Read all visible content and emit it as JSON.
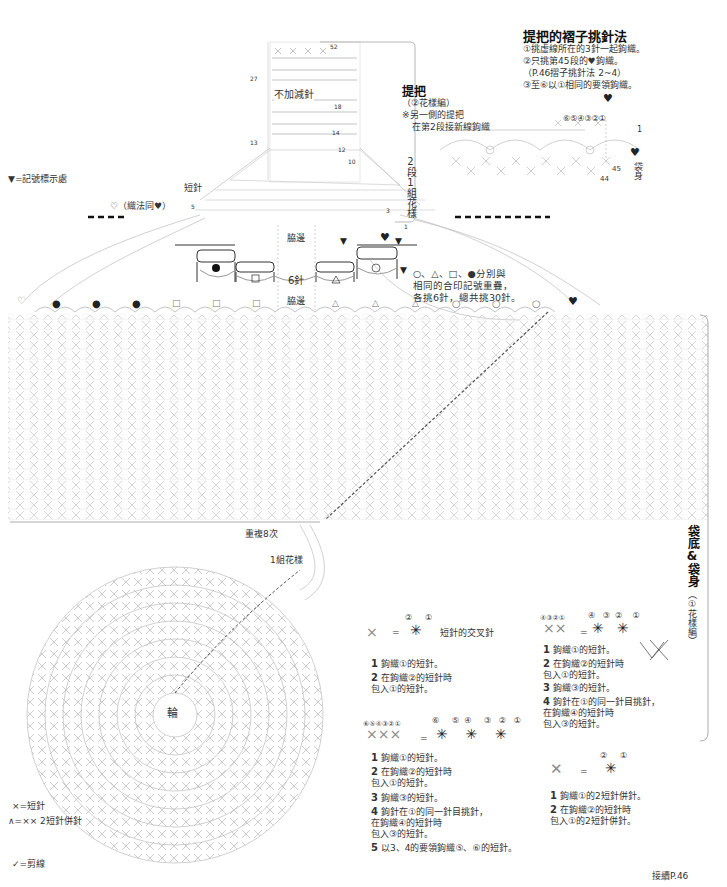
{
  "handle_pleat": {
    "title": "提把的褶子挑針法",
    "steps": [
      "①挑虛線所在的3針一起鉤織。",
      "②只挑第45段的♥鉤織。",
      "（P.46摺子挑針法 2~4）",
      "③至⑥以①相同的要領鉤織。"
    ],
    "marks": [
      "⑥",
      "⑤",
      "④",
      "③",
      "②",
      "①"
    ],
    "row_labels": [
      "1",
      "45",
      "44"
    ],
    "body_label": "袋身"
  },
  "handle": {
    "title": "提把",
    "subtitle": "（②花樣編）",
    "note_1": "※另一側的提把",
    "note_2": "在第2段接新線鉤織",
    "no_change": "不加減針",
    "pattern_repeat": "2段1組花樣",
    "row_numbers": [
      "52",
      "27",
      "18",
      "14",
      "13",
      "12",
      "10",
      "5",
      "3",
      "1"
    ],
    "short_stitch": "短針"
  },
  "legend_top": {
    "marker": "▼=記號標示處",
    "open_heart": "♡（織法同♥）"
  },
  "joining": {
    "side_label_top": "脇邊",
    "side_label_bottom": "脇邊",
    "six_stitches": "6針",
    "note_lines": [
      "○、△、□、●分別與",
      "相同的合印記號重疊，",
      "各挑6針，總共挑30針。"
    ],
    "symbols_top_row": [
      "●",
      "□",
      "6針",
      "△",
      "○"
    ],
    "symbols_edge": [
      "♡",
      "●",
      "●",
      "●",
      "□",
      "□",
      "□",
      "△",
      "△",
      "△",
      "○",
      "○",
      "○",
      "♥"
    ]
  },
  "body": {
    "repeat": "重複8次",
    "one_set": "1組花樣",
    "center": "輪",
    "side_title": "袋底&袋身",
    "side_sub": "（①花樣編）"
  },
  "diagram_1": {
    "marks": [
      "②",
      "①"
    ],
    "name": "短針的交叉針",
    "steps": [
      {
        "n": "1",
        "text": "鉤織①的短針。"
      },
      {
        "n": "2",
        "text": "在鉤織②的短針時\n包入①的短針。"
      }
    ]
  },
  "diagram_2": {
    "marks_left": "④③②①",
    "marks": [
      "④",
      "③",
      "②",
      "①"
    ],
    "steps": [
      {
        "n": "1",
        "text": "鉤織①的短針。"
      },
      {
        "n": "2",
        "text": "在鉤織②的短針時\n包入①的短針。"
      },
      {
        "n": "3",
        "text": "鉤織③的短針。"
      },
      {
        "n": "4",
        "text": "鉤針在①的同一針目挑針，\n在鉤織④的短針時\n包入③的短針。"
      }
    ]
  },
  "diagram_3": {
    "marks_left": "⑥⑤④③②①",
    "marks": [
      "⑥",
      "⑤",
      "④",
      "③",
      "②",
      "①"
    ],
    "steps": [
      {
        "n": "1",
        "text": "鉤織①的短針。"
      },
      {
        "n": "2",
        "text": "在鉤織②的短針時\n包入①的短針。"
      },
      {
        "n": "3",
        "text": "鉤織③的短針。"
      },
      {
        "n": "4",
        "text": "鉤針在①的同一針目挑針，\n在鉤織④的短針時\n包入③的短針。"
      },
      {
        "n": "5",
        "text": "以3、4的要領鉤織⑤、⑥的短針。"
      }
    ]
  },
  "diagram_4": {
    "marks": [
      "②",
      "①"
    ],
    "steps": [
      {
        "n": "1",
        "text": "鉤織①的2短針併針。"
      },
      {
        "n": "2",
        "text": "在鉤織②的短針時\n包入①的2短針併針。"
      }
    ]
  },
  "legend_bottom": {
    "sc": "×=短針",
    "dec": "∧=⨯⨯ 2短針併針",
    "cut": "✓=剪線"
  },
  "footer": {
    "continue": "接續P.46"
  }
}
